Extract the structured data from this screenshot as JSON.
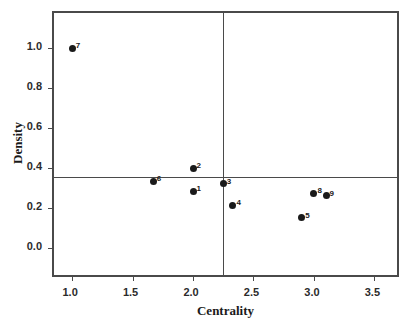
{
  "chart_data": {
    "type": "scatter",
    "title": "",
    "xlabel": "Centrality",
    "ylabel": "Density",
    "xlim": [
      0.85,
      3.72
    ],
    "ylim": [
      -0.155,
      1.175
    ],
    "xticks": [
      "1.0",
      "1.5",
      "2.0",
      "2.5",
      "3.0",
      "3.5"
    ],
    "xtick_values": [
      1.0,
      1.5,
      2.0,
      2.5,
      3.0,
      3.5
    ],
    "yticks": [
      "0.0",
      "0.2",
      "0.4",
      "0.6",
      "0.8",
      "1.0"
    ],
    "ytick_values": [
      0.0,
      0.2,
      0.4,
      0.6,
      0.8,
      1.0
    ],
    "grid": false,
    "legend": "none",
    "reference_lines": {
      "vertical_x": 2.25,
      "horizontal_y": 0.355
    },
    "point_labels": [
      "1",
      "2",
      "3",
      "4",
      "5",
      "6",
      "7",
      "8",
      "9"
    ],
    "points": [
      {
        "label": "7",
        "x": 1.0,
        "y": 1.0
      },
      {
        "label": "6",
        "x": 1.67,
        "y": 0.335
      },
      {
        "label": "2",
        "x": 2.0,
        "y": 0.398
      },
      {
        "label": "1",
        "x": 2.0,
        "y": 0.285
      },
      {
        "label": "3",
        "x": 2.25,
        "y": 0.322
      },
      {
        "label": "4",
        "x": 2.33,
        "y": 0.213
      },
      {
        "label": "5",
        "x": 2.9,
        "y": 0.152
      },
      {
        "label": "8",
        "x": 3.0,
        "y": 0.275
      },
      {
        "label": "9",
        "x": 3.1,
        "y": 0.262
      }
    ]
  },
  "axes": {
    "x_title": "Centrality",
    "y_title": "Density"
  },
  "caption": {
    "text": ""
  }
}
